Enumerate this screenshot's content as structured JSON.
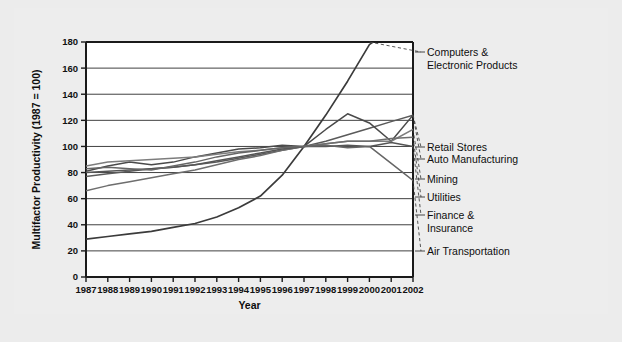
{
  "figure": {
    "background_color": "#ededed",
    "plot_background_color": "#ffffff"
  },
  "chart_data": {
    "type": "line",
    "title": "",
    "xlabel": "Year",
    "ylabel": "Multifactor Productivity (1987 = 100)",
    "x": [
      1987,
      1988,
      1989,
      1990,
      1991,
      1992,
      1993,
      1994,
      1995,
      1996,
      1997,
      1998,
      1999,
      2000,
      2001,
      2002
    ],
    "categories": [
      "1987",
      "1988",
      "1989",
      "1990",
      "1991",
      "1992",
      "1993",
      "1994",
      "1995",
      "1996",
      "1997",
      "1998",
      "1999",
      "2000",
      "2001",
      "2002"
    ],
    "xlim": [
      1987,
      2002
    ],
    "ylim": [
      0,
      180
    ],
    "yticks": [
      0,
      20,
      40,
      60,
      80,
      100,
      120,
      140,
      160,
      180
    ],
    "xticks": [
      "1987",
      "1988",
      "1989",
      "1990",
      "1991",
      "1992",
      "1993",
      "1994",
      "1995",
      "1996",
      "1997",
      "1998",
      "1999",
      "2000",
      "2001",
      "2002"
    ],
    "grid": true,
    "legend_position": "right-labels",
    "series": [
      {
        "name": "Computers & Electronic Products",
        "color": "#3b3b3b",
        "width": 1.7,
        "values": [
          29,
          31,
          33,
          35,
          38,
          41,
          46,
          53,
          62,
          78,
          100,
          124,
          150,
          178,
          190,
          205
        ],
        "label_y": 180
      },
      {
        "name": "Retail Stores",
        "color": "#5a5a5a",
        "width": 1.5,
        "values": [
          77,
          79,
          81,
          83,
          84,
          86,
          88,
          91,
          94,
          97,
          100,
          104,
          109,
          114,
          119,
          124
        ],
        "label_y": 130
      },
      {
        "name": "Auto Manufacturing",
        "color": "#4a4a4a",
        "width": 1.5,
        "values": [
          81,
          85,
          88,
          86,
          88,
          92,
          95,
          98,
          99,
          101,
          100,
          113,
          125,
          118,
          104,
          124
        ],
        "label_y": 124
      },
      {
        "name": "Mining",
        "color": "#7d7d7d",
        "width": 1.5,
        "values": [
          85,
          88,
          89,
          90,
          91,
          92,
          94,
          96,
          97,
          99,
          100,
          102,
          104,
          104,
          104,
          113
        ],
        "label_y": 112
      },
      {
        "name": "Utilities",
        "color": "#6e6e6e",
        "width": 1.5,
        "values": [
          66,
          70,
          73,
          76,
          79,
          82,
          86,
          90,
          93,
          97,
          100,
          102,
          104,
          104,
          106,
          107
        ],
        "label_y": 105
      },
      {
        "name": "Finance & Insurance",
        "color": "#555555",
        "width": 1.5,
        "values": [
          80,
          81,
          82,
          83,
          84,
          86,
          89,
          92,
          95,
          98,
          100,
          100,
          101,
          100,
          103,
          100
        ],
        "label_y": 97
      },
      {
        "name": "Air Transportation",
        "color": "#666666",
        "width": 1.5,
        "values": [
          83,
          84,
          83,
          82,
          85,
          88,
          92,
          95,
          97,
          99,
          100,
          101,
          99,
          100,
          87,
          74
        ],
        "label_y": 78
      }
    ]
  },
  "legend": {
    "items": [
      {
        "label": "Computers &"
      },
      {
        "label": "Electronic Products"
      },
      {
        "label": "Retail Stores"
      },
      {
        "label": "Auto Manufacturing"
      },
      {
        "label": "Mining"
      },
      {
        "label": "Utilities"
      },
      {
        "label": "Finance &"
      },
      {
        "label": "Insurance"
      },
      {
        "label": "Air Transportation"
      }
    ]
  }
}
